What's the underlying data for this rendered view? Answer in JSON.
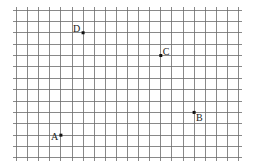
{
  "diagram": {
    "type": "coordinate-grid",
    "grid": {
      "columns": 20,
      "rows": 13,
      "origin_x": 16.5,
      "origin_y": 10,
      "cell_width": 11.1,
      "cell_height": 11.38,
      "overhang": 3.5,
      "line_color": "#6b6b6b"
    },
    "points": [
      {
        "label": "A",
        "col": 4,
        "row": 11,
        "label_dx": -10,
        "label_dy": 5
      },
      {
        "label": "B",
        "col": 16,
        "row": 9,
        "label_dx": 2,
        "label_dy": 9
      },
      {
        "label": "C",
        "col": 13,
        "row": 4,
        "label_dx": 2,
        "label_dy": -1
      },
      {
        "label": "D",
        "col": 6,
        "row": 2,
        "label_dx": -10,
        "label_dy": -1
      }
    ],
    "marker_color": "#111111"
  }
}
